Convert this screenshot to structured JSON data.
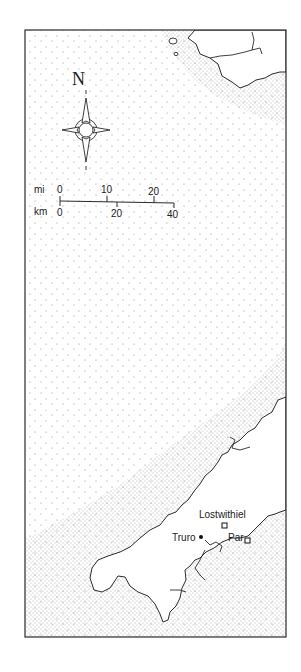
{
  "map": {
    "frame": {
      "x": 25,
      "y": 30,
      "w": 261,
      "h": 607
    },
    "colors": {
      "ink": "#2a2a2a",
      "land": "#ffffff",
      "sea_stipple": "#555555"
    },
    "compass": {
      "label": "N",
      "cx": 57,
      "cy": 130
    },
    "scale_bar": {
      "miles_label": "mi",
      "km_label": "km",
      "miles_ticks": [
        "0",
        "10",
        "20"
      ],
      "km_ticks": [
        "0",
        "20",
        "40"
      ]
    },
    "places": [
      {
        "name": "Lostwithiel",
        "symbol": "square",
        "x": 225,
        "y": 526
      },
      {
        "name": "Truro",
        "symbol": "dot",
        "x": 201,
        "y": 537
      },
      {
        "name": "Par",
        "symbol": "square",
        "x": 247,
        "y": 540
      }
    ]
  }
}
